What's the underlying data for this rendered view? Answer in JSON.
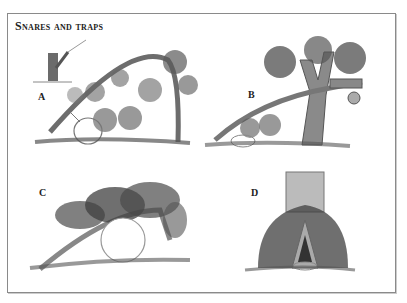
{
  "title": "Snares and traps",
  "panels": [
    {
      "label": "A",
      "description": "Man bending sapling; spring snare with bent sapling arching over noose by bushes"
    },
    {
      "label": "B",
      "description": "Log lever wedged in forked tree with noose snare near bushes"
    },
    {
      "label": "C",
      "description": "Bent pole snare covered with leafy branches over noose"
    },
    {
      "label": "D",
      "description": "Tree trunk with brush-covered opening and noose at entrance"
    }
  ]
}
